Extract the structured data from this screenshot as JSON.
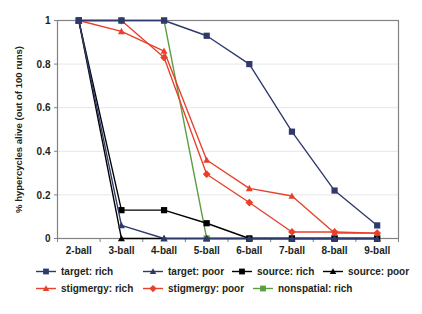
{
  "chart_data": {
    "type": "line",
    "title": "",
    "xlabel": "",
    "ylabel": "% hypercycles alive (out of 100 runs)",
    "categories": [
      "2-ball",
      "3-ball",
      "4-ball",
      "5-ball",
      "6-ball",
      "7-ball",
      "8-ball",
      "9-ball"
    ],
    "ylim": [
      0,
      1
    ],
    "yticks": [
      "0",
      "0.2",
      "0.4",
      "0.6",
      "0.8",
      "1"
    ],
    "ytick_values": [
      0,
      0.2,
      0.4,
      0.6,
      0.8,
      1
    ],
    "grid": "horizontal",
    "legend_position": "bottom",
    "series": [
      {
        "name": "target: rich",
        "color": "#2e3a6b",
        "marker": "square",
        "values": [
          1,
          1,
          1,
          0.93,
          0.8,
          0.49,
          0.22,
          0.06
        ]
      },
      {
        "name": "target: poor",
        "color": "#2e3a6b",
        "marker": "triangle",
        "values": [
          1,
          0.06,
          0,
          0,
          0,
          0,
          0,
          0
        ]
      },
      {
        "name": "source: rich",
        "color": "#000000",
        "marker": "square",
        "values": [
          1,
          0.13,
          0.13,
          0.07,
          0,
          0,
          0,
          0
        ]
      },
      {
        "name": "source: poor",
        "color": "#000000",
        "marker": "triangle",
        "values": [
          1,
          0,
          0,
          0,
          0,
          0,
          0,
          0
        ]
      },
      {
        "name": "stigmergy: rich",
        "color": "#e8402a",
        "marker": "triangle",
        "values": [
          1,
          0.95,
          0.86,
          0.36,
          0.23,
          0.195,
          0.025,
          0.025
        ]
      },
      {
        "name": "stigmergy: poor",
        "color": "#e8402a",
        "marker": "diamond",
        "values": [
          1,
          1,
          0.83,
          0.295,
          0.165,
          0.03,
          0.03,
          0.025
        ]
      },
      {
        "name": "nonspatial: rich",
        "color": "#5a9e43",
        "marker": "square",
        "values": [
          1,
          1,
          1,
          0,
          0,
          0,
          0,
          0
        ]
      }
    ]
  },
  "legend": {
    "row1": [
      "target: rich",
      "target: poor",
      "source: rich",
      "source: poor"
    ],
    "row2": [
      "stigmergy: rich",
      "stigmergy: poor",
      "nonspatial: rich"
    ]
  },
  "colors": {
    "navy": "#2e3a6b",
    "black": "#000000",
    "red": "#e8402a",
    "green": "#5a9e43",
    "axis": "#808285",
    "grid": "#e6e7e8",
    "text": "#231f20"
  }
}
